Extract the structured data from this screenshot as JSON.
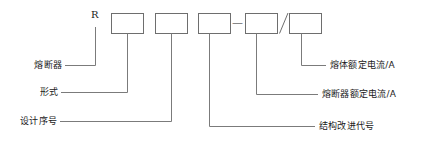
{
  "diagram": {
    "prefix_letter": "R",
    "separator_dash": "—",
    "separator_slash": "/",
    "boxes": [
      {
        "id": "box-form",
        "value": ""
      },
      {
        "id": "box-design-number",
        "value": ""
      },
      {
        "id": "box-structure-code",
        "value": ""
      },
      {
        "id": "box-fuse-rated-current",
        "value": ""
      },
      {
        "id": "box-element-rated-current",
        "value": ""
      }
    ],
    "labels_left": [
      {
        "id": "label-fuse",
        "text": "熔断器"
      },
      {
        "id": "label-form",
        "text": "形式"
      },
      {
        "id": "label-design-number",
        "text": "设计序号"
      }
    ],
    "labels_right": [
      {
        "id": "label-element-rated-current",
        "text": "熔体额定电流/A"
      },
      {
        "id": "label-fuse-rated-current",
        "text": "熔断器额定电流/A"
      },
      {
        "id": "label-structure-code",
        "text": "结构改进代号"
      }
    ],
    "colors": {
      "line": "#7b7b7b",
      "box_stroke": "#6e6e6e",
      "text": "#1a1a1a",
      "background": "#ffffff"
    }
  }
}
